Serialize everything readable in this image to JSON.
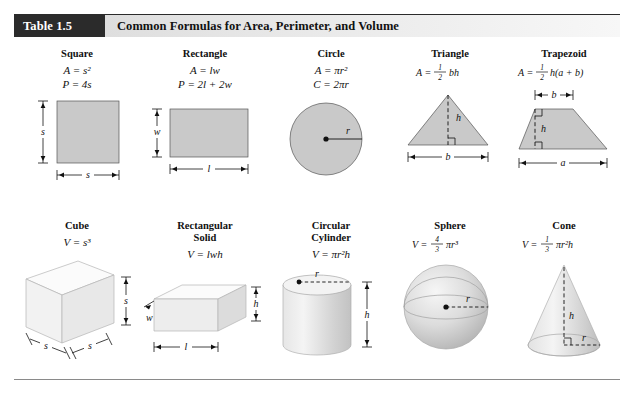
{
  "header": {
    "table_number": "Table 1.5",
    "title": "Common Formulas for Area, Perimeter, and Volume",
    "number_bg": "#2b2b2b",
    "number_fg": "#ffffff",
    "bar_bg": "#e2e2e2"
  },
  "style": {
    "fill_gray": "#c9c9c9",
    "line_color": "#111111",
    "rule_color": "#8a8a8a"
  },
  "plane_figures": [
    {
      "name": "Square",
      "formulas": [
        "A = s²",
        "P = 4s"
      ],
      "labels": {
        "side_vertical": "s",
        "side_horizontal": "s"
      }
    },
    {
      "name": "Rectangle",
      "formulas": [
        "A = lw",
        "P = 2l + 2w"
      ],
      "labels": {
        "height": "w",
        "width": "l"
      }
    },
    {
      "name": "Circle",
      "formulas": [
        "A = πr²",
        "C = 2πr"
      ],
      "labels": {
        "radius": "r"
      }
    },
    {
      "name": "Triangle",
      "formulas": [
        "A = ½bh"
      ],
      "fraction": {
        "num": "1",
        "den": "2",
        "rest": "bh"
      },
      "labels": {
        "height": "h",
        "base": "b"
      }
    },
    {
      "name": "Trapezoid",
      "formulas": [
        "A = ½h(a + b)"
      ],
      "fraction": {
        "num": "1",
        "den": "2",
        "rest": "h(a + b)"
      },
      "labels": {
        "top": "b",
        "height": "h",
        "bottom": "a"
      }
    }
  ],
  "solid_figures": [
    {
      "name": "Cube",
      "formulas": [
        "V = s³"
      ],
      "labels": {
        "depth": "s",
        "width": "s",
        "height": "s"
      }
    },
    {
      "name": "Rectangular\nSolid",
      "formulas": [
        "V = lwh"
      ],
      "labels": {
        "width": "w",
        "length": "l",
        "height": "h"
      }
    },
    {
      "name": "Circular\nCylinder",
      "formulas": [
        "V = πr²h"
      ],
      "labels": {
        "radius": "r",
        "height": "h"
      }
    },
    {
      "name": "Sphere",
      "formulas": [
        "V = ⁴⁄₃πr³"
      ],
      "fraction": {
        "num": "4",
        "den": "3",
        "rest": "πr³"
      },
      "labels": {
        "radius": "r"
      }
    },
    {
      "name": "Cone",
      "formulas": [
        "V = ⅓πr²h"
      ],
      "fraction": {
        "num": "1",
        "den": "3",
        "rest": "πr²h"
      },
      "labels": {
        "height": "h",
        "radius": "r"
      }
    }
  ]
}
